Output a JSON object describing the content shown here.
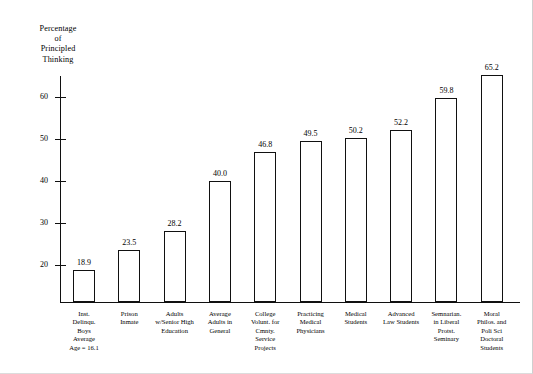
{
  "figure": {
    "name": "percentage-of-principled-thinking-bar-chart",
    "background_color": "#ffffff",
    "ink_color": "#111111"
  },
  "axis_title": {
    "lines": [
      "Percentage",
      "of",
      "Principled",
      "Thinking"
    ]
  },
  "chart_data": {
    "type": "bar",
    "title": "",
    "xlabel": "",
    "ylabel": "Percentage of Principled Thinking",
    "ylim": [
      14,
      68
    ],
    "yticks": [
      20,
      30,
      40,
      50,
      60
    ],
    "ytick_labels": [
      "20",
      "30",
      "40",
      "50",
      "60"
    ],
    "grid": false,
    "legend": "none",
    "bar_style": {
      "fill": "#ffffff",
      "edge": "#111111",
      "edge_width": 1
    },
    "categories": [
      "Inst. Delinqu. Boys Average Age = 16.1",
      "Prison Inmate",
      "Adults w/Senior High Education",
      "Average Adults in General",
      "College Volunt. for Cmnty. Service Projects",
      "Practicing Medical Physicians",
      "Medical Students",
      "Advanced Law Students",
      "Semnarian. in Liberal Protst. Seminary",
      "Moral Philos. and Poli Sci Doctoral Students"
    ],
    "category_label_lines": [
      [
        "Inst.",
        "Delinqu.",
        "Boys",
        "Average",
        "Age = 16.1"
      ],
      [
        "Prison",
        "Inmate"
      ],
      [
        "Adults",
        "w/Senior High",
        "Education"
      ],
      [
        "Average",
        "Adults in",
        "General"
      ],
      [
        "College",
        "Volunt. for",
        "Cmnty.",
        "Service",
        "Projects"
      ],
      [
        "Practicing",
        "Medical",
        "Physicians"
      ],
      [
        "Medical",
        "Students"
      ],
      [
        "Advanced",
        "Law Students"
      ],
      [
        "Semnarian.",
        "in Liberal",
        "Protst.",
        "Seminary"
      ],
      [
        "Moral",
        "Philos. and",
        "Poli Sci",
        "Doctoral",
        "Students"
      ]
    ],
    "values": [
      18.9,
      23.5,
      28.2,
      40.0,
      46.8,
      49.5,
      50.2,
      52.2,
      59.8,
      65.2
    ],
    "value_labels": [
      "18.9",
      "23.5",
      "28.2",
      "40.0",
      "46.8",
      "49.5",
      "50.2",
      "52.2",
      "59.8",
      "65.2"
    ]
  }
}
